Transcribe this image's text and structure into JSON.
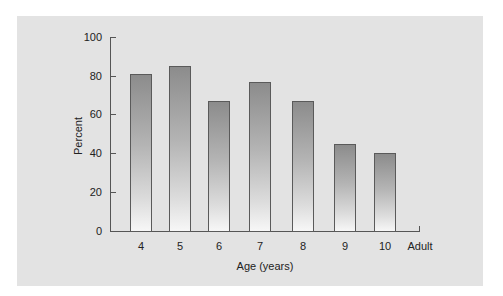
{
  "chart_data": {
    "type": "bar",
    "title": "",
    "xlabel": "Age (years)",
    "ylabel": "Percent",
    "ylim": [
      0,
      100
    ],
    "yticks": [
      "0",
      "20",
      "40",
      "60",
      "80",
      "100"
    ],
    "categories": [
      "4",
      "5",
      "6",
      "7",
      "8",
      "9",
      "10",
      "Adult"
    ],
    "values": [
      81,
      85,
      67,
      77,
      67,
      45,
      40,
      null
    ],
    "grid": false,
    "legend": null,
    "colors": {
      "bar_top": "#8c8c8c",
      "bar_bottom": "#f7f7f7",
      "bar_border": "#5a5a5a",
      "panel_background": "#e3e3e3",
      "axis": "#555555"
    }
  }
}
